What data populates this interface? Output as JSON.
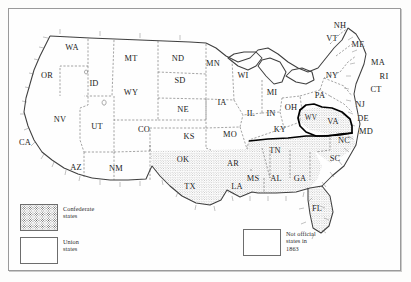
{
  "legend": {
    "entries": [
      {
        "id": "confederate",
        "swatch": "stippled",
        "label": "Confederate\nstates"
      },
      {
        "id": "union",
        "swatch": "plain",
        "label": "Union\nstates"
      },
      {
        "id": "not_official",
        "swatch": "plain",
        "label": "Not official\nstates in\n1863"
      }
    ]
  },
  "colors": {
    "frame": "#9a9a9a",
    "coastline": "#4a4a4a",
    "border_dashed": "#555555",
    "border_bold": "#000000",
    "stipple": "#5d5d5d",
    "paper": "#fefefe",
    "label_text": "#1b1b1b"
  },
  "map": {
    "classification": {
      "confederate": [
        "TX",
        "AR",
        "LA",
        "MS",
        "AL",
        "GA",
        "FL",
        "SC",
        "NC",
        "VA",
        "TN"
      ],
      "union": [
        "WA",
        "OR",
        "CA",
        "NV",
        "ID",
        "MT",
        "WY",
        "UT",
        "CO",
        "ND",
        "SD",
        "NE",
        "KS",
        "MN",
        "IA",
        "MO",
        "WI",
        "IL",
        "MI",
        "IN",
        "OH",
        "KY",
        "WV",
        "PA",
        "NY",
        "NJ",
        "DE",
        "MD",
        "CT",
        "RI",
        "MA",
        "VT",
        "NH",
        "ME"
      ],
      "not_official": [
        "AZ",
        "NM",
        "OK"
      ]
    },
    "labels": [
      {
        "abbr": "WA",
        "x": 72,
        "y": 47,
        "size": "md"
      },
      {
        "abbr": "OR",
        "x": 47,
        "y": 75,
        "size": "md"
      },
      {
        "abbr": "ID",
        "x": 94,
        "y": 83,
        "size": "md"
      },
      {
        "abbr": "MT",
        "x": 131,
        "y": 58,
        "size": "md"
      },
      {
        "abbr": "ND",
        "x": 178,
        "y": 58,
        "size": "md"
      },
      {
        "abbr": "SD",
        "x": 180,
        "y": 80,
        "size": "md"
      },
      {
        "abbr": "MN",
        "x": 213,
        "y": 63,
        "size": "md"
      },
      {
        "abbr": "WI",
        "x": 243,
        "y": 75,
        "size": "md"
      },
      {
        "abbr": "WY",
        "x": 131,
        "y": 92,
        "size": "md"
      },
      {
        "abbr": "NE",
        "x": 183,
        "y": 109,
        "size": "md"
      },
      {
        "abbr": "IA",
        "x": 222,
        "y": 102,
        "size": "md"
      },
      {
        "abbr": "MI",
        "x": 272,
        "y": 92,
        "size": "md"
      },
      {
        "abbr": "NV",
        "x": 60,
        "y": 119,
        "size": "md"
      },
      {
        "abbr": "UT",
        "x": 97,
        "y": 126,
        "size": "md"
      },
      {
        "abbr": "CO",
        "x": 144,
        "y": 129,
        "size": "md"
      },
      {
        "abbr": "KS",
        "x": 189,
        "y": 136,
        "size": "md"
      },
      {
        "abbr": "MO",
        "x": 230,
        "y": 134,
        "size": "md"
      },
      {
        "abbr": "IL",
        "x": 251,
        "y": 113,
        "size": "md"
      },
      {
        "abbr": "IN",
        "x": 271,
        "y": 113,
        "size": "md"
      },
      {
        "abbr": "OH",
        "x": 291,
        "y": 107,
        "size": "md"
      },
      {
        "abbr": "PA",
        "x": 320,
        "y": 95,
        "size": "md"
      },
      {
        "abbr": "NY",
        "x": 332,
        "y": 75,
        "size": "md"
      },
      {
        "abbr": "NH",
        "x": 340,
        "y": 25,
        "size": "md"
      },
      {
        "abbr": "VT",
        "x": 332,
        "y": 38,
        "size": "md"
      },
      {
        "abbr": "ME",
        "x": 358,
        "y": 44,
        "size": "md"
      },
      {
        "abbr": "MA",
        "x": 378,
        "y": 62,
        "size": "md"
      },
      {
        "abbr": "RI",
        "x": 384,
        "y": 76,
        "size": "md"
      },
      {
        "abbr": "CT",
        "x": 376,
        "y": 89,
        "size": "md"
      },
      {
        "abbr": "NJ",
        "x": 360,
        "y": 104,
        "size": "md"
      },
      {
        "abbr": "DE",
        "x": 363,
        "y": 118,
        "size": "md"
      },
      {
        "abbr": "MD",
        "x": 366,
        "y": 131,
        "size": "md"
      },
      {
        "abbr": "WV",
        "x": 311,
        "y": 118,
        "size": "sm"
      },
      {
        "abbr": "VA",
        "x": 333,
        "y": 121,
        "size": "md"
      },
      {
        "abbr": "KY",
        "x": 280,
        "y": 129,
        "size": "md"
      },
      {
        "abbr": "NC",
        "x": 344,
        "y": 140,
        "size": "md"
      },
      {
        "abbr": "TN",
        "x": 275,
        "y": 150,
        "size": "md"
      },
      {
        "abbr": "SC",
        "x": 335,
        "y": 158,
        "size": "md"
      },
      {
        "abbr": "CA",
        "x": 25,
        "y": 142,
        "size": "md"
      },
      {
        "abbr": "AZ",
        "x": 76,
        "y": 167,
        "size": "md"
      },
      {
        "abbr": "NM",
        "x": 116,
        "y": 168,
        "size": "md"
      },
      {
        "abbr": "OK",
        "x": 183,
        "y": 159,
        "size": "md"
      },
      {
        "abbr": "AR",
        "x": 233,
        "y": 163,
        "size": "md"
      },
      {
        "abbr": "MS",
        "x": 253,
        "y": 178,
        "size": "md"
      },
      {
        "abbr": "AL",
        "x": 276,
        "y": 178,
        "size": "md"
      },
      {
        "abbr": "GA",
        "x": 300,
        "y": 178,
        "size": "md"
      },
      {
        "abbr": "LA",
        "x": 237,
        "y": 186,
        "size": "md"
      },
      {
        "abbr": "TX",
        "x": 190,
        "y": 186,
        "size": "md"
      },
      {
        "abbr": "FL",
        "x": 317,
        "y": 208,
        "size": "md"
      }
    ]
  }
}
